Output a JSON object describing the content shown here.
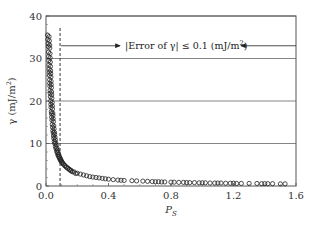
{
  "chart_data": {
    "type": "scatter",
    "title": "",
    "xlabel": "P_S",
    "ylabel": "γ (mJ/m²)",
    "xlim": [
      0.0,
      1.6
    ],
    "ylim": [
      0,
      40
    ],
    "x_ticks": [
      "0.0",
      "0.4",
      "0.8",
      "1.2",
      "1.6"
    ],
    "y_ticks": [
      "0",
      "10",
      "20",
      "30",
      "40"
    ],
    "grid": {
      "horizontal_lines_at": [
        10,
        20,
        30,
        40
      ],
      "vertical": false
    },
    "legend": null,
    "threshold_line": {
      "type": "vertical-dashed",
      "x": 0.09
    },
    "annotation": {
      "text": "|Error of γ| ≤ 0.1 (mJ/m²)",
      "y": 33,
      "arrows": "left arrow points to dashed line; right arrow from plot edge points to text"
    },
    "series": [
      {
        "name": "γ vs P_S",
        "marker": "open-circle",
        "x": [
          0.01,
          0.012,
          0.014,
          0.015,
          0.016,
          0.017,
          0.018,
          0.019,
          0.02,
          0.021,
          0.022,
          0.023,
          0.024,
          0.025,
          0.026,
          0.027,
          0.028,
          0.03,
          0.031,
          0.032,
          0.034,
          0.035,
          0.036,
          0.038,
          0.04,
          0.042,
          0.044,
          0.046,
          0.048,
          0.05,
          0.053,
          0.056,
          0.06,
          0.064,
          0.068,
          0.072,
          0.076,
          0.08,
          0.085,
          0.09,
          0.095,
          0.1,
          0.11,
          0.12,
          0.13,
          0.14,
          0.15,
          0.16,
          0.18,
          0.2,
          0.22,
          0.24,
          0.26,
          0.28,
          0.3,
          0.32,
          0.34,
          0.36,
          0.38,
          0.4,
          0.43,
          0.46,
          0.48,
          0.5,
          0.55,
          0.58,
          0.62,
          0.65,
          0.68,
          0.7,
          0.72,
          0.74,
          0.76,
          0.8,
          0.82,
          0.85,
          0.88,
          0.9,
          0.92,
          0.95,
          0.98,
          1.0,
          1.02,
          1.05,
          1.08,
          1.1,
          1.12,
          1.15,
          1.18,
          1.2,
          1.22,
          1.25,
          1.3,
          1.35,
          1.38,
          1.4,
          1.42,
          1.45,
          1.5,
          1.53
        ],
        "y": [
          35.5,
          34.5,
          33.5,
          32.8,
          31.5,
          30.5,
          29.5,
          28.5,
          27.5,
          26.8,
          26.0,
          25.0,
          24.2,
          23.5,
          22.5,
          21.8,
          21.0,
          20.0,
          19.2,
          18.5,
          17.5,
          17.0,
          16.2,
          15.5,
          14.5,
          13.8,
          13.0,
          12.5,
          11.8,
          11.2,
          10.5,
          10.0,
          9.3,
          8.8,
          8.2,
          7.8,
          7.3,
          7.0,
          6.6,
          6.2,
          5.9,
          5.6,
          5.2,
          4.8,
          4.5,
          4.2,
          3.9,
          3.7,
          3.3,
          3.0,
          2.8,
          2.6,
          2.4,
          2.2,
          2.1,
          2.0,
          1.9,
          1.8,
          1.7,
          1.6,
          1.5,
          1.4,
          1.35,
          1.3,
          1.25,
          1.2,
          1.15,
          1.1,
          1.05,
          1.0,
          1.0,
          0.95,
          0.95,
          0.9,
          0.9,
          0.85,
          0.85,
          0.8,
          0.8,
          0.8,
          0.75,
          0.75,
          0.75,
          0.7,
          0.7,
          0.7,
          0.7,
          0.65,
          0.65,
          0.65,
          0.6,
          0.6,
          0.6,
          0.6,
          0.55,
          0.55,
          0.55,
          0.55,
          0.5,
          0.5
        ]
      }
    ]
  },
  "labels": {
    "ylabel": "γ (mJ/m",
    "ylabel_sup": "2",
    "ylabel_close": ")",
    "xlabel_main": "P",
    "xlabel_sub": "S",
    "annotation_pre": "|Error of γ| ≤ 0.1 (mJ/m",
    "annotation_sup": "2",
    "annotation_post": ")"
  }
}
